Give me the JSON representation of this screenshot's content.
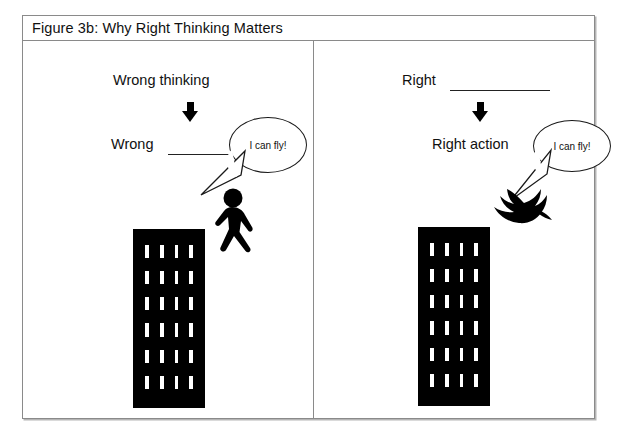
{
  "figure": {
    "title": "Figure 3b: Why Right Thinking Matters",
    "panels": [
      {
        "id": "left",
        "name": "wrong-thinking-panel",
        "top_caption": "Wrong thinking",
        "arrow": "down-arrow",
        "bottom_caption": "Wrong",
        "bottom_caption_has_blank": true,
        "speech_bubble": "I can fly!",
        "actor": "walking-person-silhouette",
        "building": {
          "window_rows": 6,
          "window_columns": 4,
          "color": "#000000",
          "window_color": "#ffffff"
        }
      },
      {
        "id": "right",
        "name": "right-thinking-panel",
        "top_caption": "Right",
        "top_caption_has_blank": true,
        "arrow": "down-arrow",
        "bottom_caption": "Right action",
        "speech_bubble": "I can fly!",
        "actor": "flying-bird-silhouette",
        "building": {
          "window_rows": 6,
          "window_columns": 4,
          "color": "#000000",
          "window_color": "#ffffff"
        }
      }
    ],
    "colors": {
      "frame_border": "#8a8a8a",
      "ink": "#000000",
      "background": "#ffffff"
    }
  }
}
